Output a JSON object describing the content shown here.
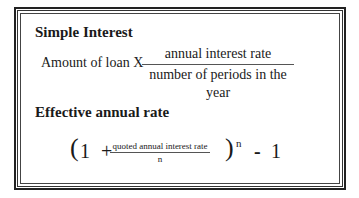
{
  "simple_interest": {
    "heading": "Simple Interest",
    "prefix": "Amount of loan X",
    "numerator": "annual interest rate",
    "denominator": "number of periods in the year"
  },
  "effective_rate": {
    "heading": "Effective annual rate",
    "open_paren": "(",
    "one": "1",
    "plus": "+",
    "numerator": "quoted annual interest rate",
    "denominator": "n",
    "close_paren": ")",
    "exponent": "n",
    "minus": "-",
    "subtract_value": "1"
  }
}
